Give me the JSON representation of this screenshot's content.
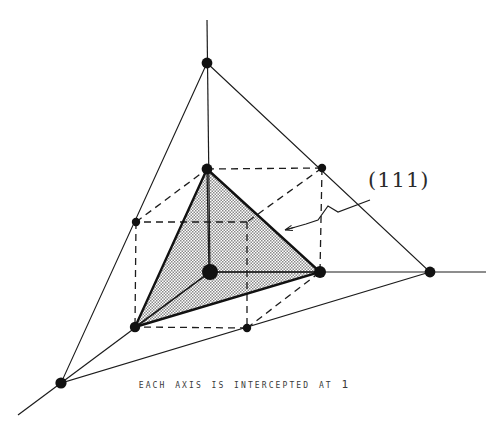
{
  "figure": {
    "title_caption": "Each axis is intercepted at 1",
    "plane_label": "(111)",
    "background_color": "#ffffff",
    "line_color": "#1c1c1c",
    "shade_color": "#c9c9c9",
    "dot_color": "#111111"
  },
  "diagram_data": {
    "type": "crystallographic-miller-index-diagram",
    "description": "Unit cube with three crystal axes and a shaded (111) plane intercepting each axis at 1",
    "axes": [
      {
        "name": "vertical-axis",
        "origin": [
          210,
          272
        ],
        "intercept_point": [
          207,
          63
        ],
        "intercept_value": 1,
        "extends_to": [
          207,
          20
        ]
      },
      {
        "name": "right-axis",
        "origin": [
          210,
          272
        ],
        "intercept_point": [
          430,
          272
        ],
        "intercept_value": 1,
        "extends_to": [
          486,
          272
        ]
      },
      {
        "name": "lower-left-axis",
        "origin": [
          210,
          272
        ],
        "intercept_point": [
          61,
          383
        ],
        "intercept_value": 1,
        "extends_to": [
          18,
          415
        ]
      }
    ],
    "cube_vertices": {
      "origin": [
        210,
        272
      ],
      "top_front": [
        207,
        169
      ],
      "top_back_right": [
        322,
        168
      ],
      "left_back": [
        136,
        222
      ],
      "hidden_back": [
        247,
        222
      ],
      "bottom_left_front": [
        135,
        327
      ],
      "bottom_mid_front": [
        247,
        328
      ],
      "right_front": [
        320,
        272
      ]
    },
    "shaded_plane": {
      "label": "(111)",
      "vertices": [
        [
          207,
          169
        ],
        [
          320,
          272
        ],
        [
          135,
          327
        ]
      ],
      "fill": "halftone-gray"
    },
    "outer_triangle": {
      "vertices": [
        [
          207,
          63
        ],
        [
          430,
          272
        ],
        [
          61,
          383
        ]
      ]
    },
    "marker_dots": [
      {
        "point": [
          210,
          272
        ],
        "radius": 8,
        "role": "origin"
      },
      {
        "point": [
          207,
          63
        ],
        "radius": 5,
        "role": "axis-intercept"
      },
      {
        "point": [
          430,
          272
        ],
        "radius": 5,
        "role": "axis-intercept"
      },
      {
        "point": [
          61,
          383
        ],
        "radius": 5,
        "role": "axis-intercept"
      },
      {
        "point": [
          207,
          169
        ],
        "radius": 5,
        "role": "cube-vertex"
      },
      {
        "point": [
          322,
          168
        ],
        "radius": 4,
        "role": "cube-vertex"
      },
      {
        "point": [
          136,
          222
        ],
        "radius": 4,
        "role": "cube-vertex"
      },
      {
        "point": [
          135,
          327
        ],
        "radius": 5,
        "role": "cube-vertex"
      },
      {
        "point": [
          247,
          328
        ],
        "radius": 4,
        "role": "cube-vertex"
      },
      {
        "point": [
          320,
          272
        ],
        "radius": 6,
        "role": "cube-vertex"
      }
    ],
    "leader_line": {
      "label_anchor": [
        370,
        200
      ],
      "arrow_tip": [
        283,
        230
      ],
      "has_zigzag": true
    }
  }
}
